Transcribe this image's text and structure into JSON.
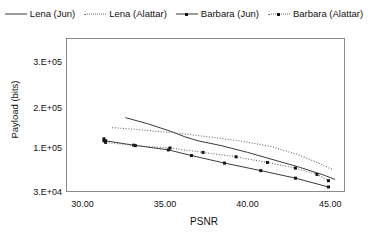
{
  "chart_data": {
    "type": "line",
    "title": "",
    "xlabel": "PSNR",
    "ylabel": "Payload (bits)",
    "xlim": [
      29.0,
      45.9
    ],
    "ylim": [
      30000,
      330000
    ],
    "yscale": "log-like",
    "grid": false,
    "legend_position": "top",
    "xticks": [
      30.0,
      35.0,
      40.0,
      45.0
    ],
    "xtick_labels": [
      "30.00",
      "35.00",
      "40.00",
      "45.00"
    ],
    "yticks": [
      30000,
      100000,
      200000,
      300000
    ],
    "ytick_labels": [
      "3.E+04",
      "1.E+05",
      "2.E+05",
      "3.E+05"
    ],
    "series": [
      {
        "name": "Lena (Jun)",
        "style": "solid",
        "markers": false,
        "color": "#3b3b3b",
        "x": [
          32.6,
          34.0,
          35.4,
          36.2,
          37.0,
          38.4,
          40.0,
          41.6,
          43.2,
          44.6,
          45.3
        ],
        "y": [
          176000,
          160000,
          141000,
          128000,
          118000,
          106000,
          93000,
          81000,
          69000,
          57000,
          50000
        ]
      },
      {
        "name": "Lena (Alattar)",
        "style": "dotted",
        "markers": false,
        "color": "#6a6a6a",
        "x": [
          31.8,
          33.4,
          35.0,
          36.6,
          38.2,
          39.8,
          41.4,
          43.0,
          44.2,
          45.2
        ],
        "y": [
          151000,
          146000,
          140000,
          133000,
          125000,
          116000,
          104000,
          90000,
          77000,
          65000
        ]
      },
      {
        "name": "Barbara (Jun)",
        "style": "solid",
        "markers": true,
        "color": "#3b3b3b",
        "x": [
          31.3,
          31.4,
          33.1,
          35.2,
          36.6,
          38.6,
          40.8,
          42.9,
          44.9
        ],
        "y": [
          123000,
          118000,
          107000,
          97000,
          88000,
          76000,
          64000,
          52000,
          38000
        ]
      },
      {
        "name": "Barbara (Alattar)",
        "style": "dotted",
        "markers": true,
        "color": "#6a6a6a",
        "x": [
          31.3,
          31.4,
          33.2,
          35.3,
          37.3,
          39.3,
          41.2,
          42.9,
          44.2,
          44.9
        ],
        "y": [
          118000,
          114000,
          106000,
          100000,
          93000,
          86000,
          77000,
          68000,
          58000,
          48000
        ]
      }
    ]
  },
  "legend": {
    "items": [
      {
        "label": "Lena (Jun)",
        "swatch": "solid"
      },
      {
        "label": "Lena (Alattar)",
        "swatch": "dotted"
      },
      {
        "label": "Barbara (Jun)",
        "swatch": "solid-marker"
      },
      {
        "label": "Barbara (Alattar)",
        "swatch": "dotted-marker"
      }
    ]
  }
}
